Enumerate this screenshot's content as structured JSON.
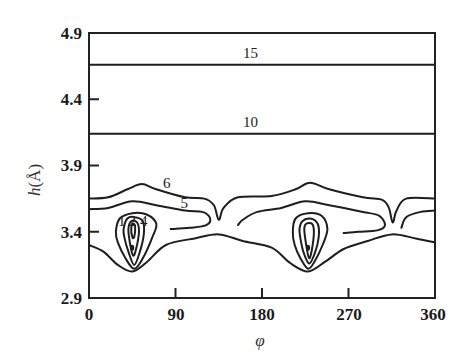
{
  "chart_data": {
    "type": "contour",
    "title": "",
    "xlabel": "φ",
    "ylabel": "h(Å)",
    "ylabel_parts": {
      "var": "h",
      "unit": "(Å)"
    },
    "xlim": [
      0,
      360
    ],
    "ylim": [
      2.9,
      4.9
    ],
    "xticks": [
      0,
      90,
      180,
      270,
      360
    ],
    "xtick_labels": [
      "0",
      "90",
      "180",
      "270",
      "360"
    ],
    "yticks": [
      2.9,
      3.4,
      3.9,
      4.4,
      4.9
    ],
    "ytick_labels": [
      "2.9",
      "3.4",
      "3.9",
      "4.4",
      "4.9"
    ],
    "grid": false,
    "contour_levels": [
      1,
      2,
      4,
      5,
      6,
      10,
      15
    ],
    "level_labels": [
      {
        "text": "15",
        "phi": 168,
        "h": 4.71
      },
      {
        "text": "10",
        "phi": 168,
        "h": 4.19
      },
      {
        "text": "6",
        "phi": 81,
        "h": 3.73
      },
      {
        "text": "5",
        "phi": 99,
        "h": 3.58
      },
      {
        "text": "4",
        "phi": 57,
        "h": 3.44
      },
      {
        "text": "2",
        "phi": 45,
        "h": 3.44
      },
      {
        "text": "1",
        "phi": 34,
        "h": 3.44
      }
    ],
    "flat_contours": [
      {
        "level": 15,
        "h": 4.66
      },
      {
        "level": 10,
        "h": 4.14
      }
    ],
    "minima": [
      {
        "phi": 45,
        "h": 3.28
      },
      {
        "phi": 228,
        "h": 3.28
      }
    ],
    "saddles": [
      {
        "phi": 135,
        "h": 3.47
      },
      {
        "phi": 315,
        "h": 3.47
      }
    ]
  }
}
